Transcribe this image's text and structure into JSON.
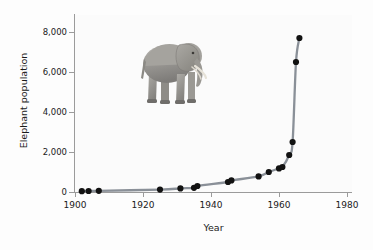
{
  "figure": {
    "background_color": "#fdfdfd",
    "plot_background_color": "#fbfbfb",
    "axis_color": "#9b9b9b",
    "line_color": "#8a9098",
    "marker_color": "#121212",
    "text_color": "#1a1a1a",
    "inset_image_name": "african-elephant-photo",
    "inset_image_alt": "Photograph of an African elephant standing in profile facing right"
  },
  "chart_data": {
    "type": "line",
    "title": "",
    "subtitle": "",
    "xlabel": "Year",
    "ylabel": "Elephant population",
    "xlim": [
      1898,
      1983
    ],
    "ylim": [
      0,
      8400
    ],
    "xticks": [
      1900,
      1920,
      1940,
      1960,
      1980
    ],
    "xticklabels": [
      "1900",
      "1920",
      "1940",
      "1960",
      "1980"
    ],
    "yticks": [
      0,
      2000,
      4000,
      6000,
      8000
    ],
    "yticklabels": [
      "0",
      "2,000",
      "4,000",
      "6,000",
      "8,000"
    ],
    "grid": false,
    "legend": null,
    "markers": "filled-circle",
    "series": [
      {
        "name": "Elephant population",
        "x": [
          1902,
          1904,
          1907,
          1925,
          1931,
          1935,
          1936,
          1945,
          1946,
          1954,
          1957,
          1960,
          1961,
          1963,
          1964,
          1965,
          1966
        ],
        "values": [
          40,
          50,
          60,
          120,
          180,
          210,
          300,
          500,
          580,
          780,
          1000,
          1180,
          1250,
          1850,
          2500,
          6500,
          7700
        ]
      }
    ],
    "annotations": []
  }
}
